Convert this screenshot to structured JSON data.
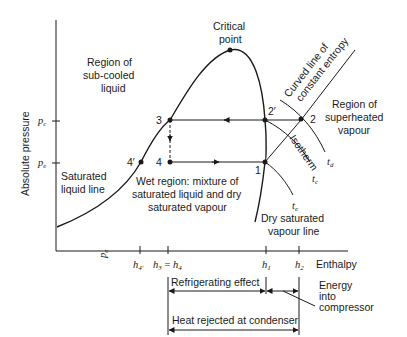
{
  "axes": {
    "y_label": "Absolute pressure",
    "x_label": "Enthalpy",
    "y_ticks": [
      {
        "main": "p",
        "sub": "c"
      },
      {
        "main": "p",
        "sub": "e"
      }
    ],
    "x_rotated_label": {
      "main": "p",
      "sub": "e"
    },
    "x_ticks": [
      {
        "main": "h",
        "sub": "4′"
      },
      {
        "main": "h",
        "sub": "3",
        "eq": " = ",
        "main2": "h",
        "sub2": "4"
      },
      {
        "main": "h",
        "sub": "1"
      },
      {
        "main": "h",
        "sub": "2"
      }
    ]
  },
  "points": {
    "critical": "Critical point",
    "critical_line1": "Critical",
    "critical_line2": "point",
    "p3": "3",
    "p4": "4",
    "p4prime": "4′",
    "p2prime": "2′",
    "p1": "1",
    "p2": "2"
  },
  "regions": {
    "subcooled": [
      "Region of",
      "sub-cooled",
      "liquid"
    ],
    "superheated": [
      "Region of",
      "superheated",
      "vapour"
    ],
    "wet": [
      "Wet region: mixture of",
      "saturated liquid and dry",
      "saturated vapour"
    ],
    "sat_liquid": [
      "Saturated",
      "liquid line"
    ],
    "dry_sat": [
      "Dry saturated",
      "vapour line"
    ]
  },
  "curves": {
    "entropy_line": [
      "Curved line of",
      "constant entropy"
    ],
    "isotherm": "Isotherm",
    "t_d": {
      "main": "t",
      "sub": "d"
    },
    "t_c": {
      "main": "t",
      "sub": "c"
    },
    "t_e": {
      "main": "t",
      "sub": "e"
    }
  },
  "dimensions": {
    "refrigerating_effect": "Refrigerating effect",
    "heat_rejected": "Heat rejected at condenser",
    "energy_compressor": [
      "Energy",
      "into",
      "compressor"
    ]
  },
  "colors": {
    "line": "#1a1a1a",
    "background": "#ffffff"
  }
}
